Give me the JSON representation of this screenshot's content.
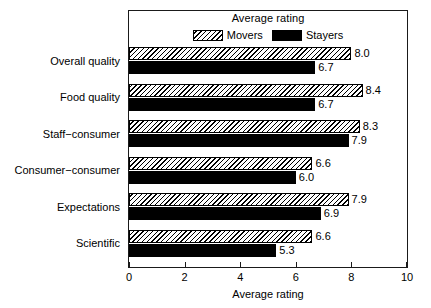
{
  "chart_data": {
    "type": "bar",
    "orientation": "horizontal",
    "title": "",
    "legend_title": "Average rating",
    "legend_position": "top-center-inside",
    "xlabel": "Average rating",
    "ylabel": "",
    "xlim": [
      0,
      10
    ],
    "xticks": [
      "0",
      "2",
      "4",
      "6",
      "8",
      "10"
    ],
    "xtick_values": [
      0,
      2,
      4,
      6,
      8,
      10
    ],
    "grid": false,
    "categories": [
      "Overall quality",
      "Food quality",
      "Staff−consumer",
      "Consumer−consumer",
      "Expectations",
      "Scientific"
    ],
    "series": [
      {
        "name": "Movers",
        "fill": "hatched",
        "values": [
          8.0,
          8.4,
          8.3,
          6.6,
          7.9,
          6.6
        ],
        "labels": [
          "8.0",
          "8.4",
          "8.3",
          "6.6",
          "7.9",
          "6.6"
        ]
      },
      {
        "name": "Stayers",
        "fill": "solid-black",
        "values": [
          6.7,
          6.7,
          7.9,
          6.0,
          6.9,
          5.3
        ],
        "labels": [
          "6.7",
          "6.7",
          "7.9",
          "6.0",
          "6.9",
          "5.3"
        ]
      }
    ]
  },
  "colors": {
    "background": "#ffffff",
    "axis": "#1a1a1a",
    "bar_outline": "#000000",
    "movers_fill": "#ffffff",
    "stayers_fill": "#000000",
    "text": "#000000"
  }
}
